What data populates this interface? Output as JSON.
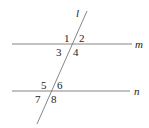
{
  "diagram": {
    "type": "parallel-lines-transversal",
    "lines": {
      "transversal": {
        "label": "l",
        "x1": 87,
        "y1": 11,
        "x2": 37,
        "y2": 124
      },
      "top": {
        "label": "m",
        "x1": 12,
        "y1": 44,
        "x2": 132,
        "y2": 44
      },
      "bottom": {
        "label": "n",
        "x1": 12,
        "y1": 91,
        "x2": 130,
        "y2": 91
      }
    },
    "angles": [
      "1",
      "2",
      "3",
      "4",
      "5",
      "6",
      "7",
      "8"
    ],
    "colors": {
      "line": "#777777",
      "text": "#222222"
    }
  }
}
